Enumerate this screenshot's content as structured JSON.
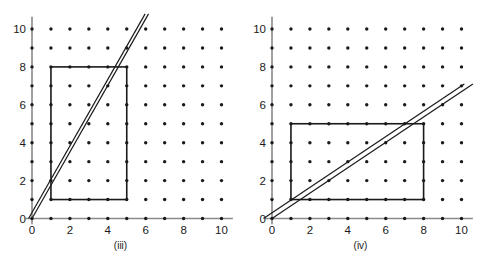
{
  "figure": {
    "panels": [
      {
        "id": "iii",
        "caption": "(iii)",
        "axes": {
          "x_ticks": [
            0,
            2,
            4,
            6,
            8,
            10
          ],
          "y_ticks": [
            0,
            2,
            4,
            6,
            8,
            10
          ],
          "x_min": 0,
          "x_max": 10,
          "y_min": 0,
          "y_max": 10,
          "x_label": "",
          "y_label": "",
          "axis_color": "#8a8a8a"
        },
        "lattice": {
          "x_values": [
            0,
            1,
            2,
            3,
            4,
            5,
            6,
            7,
            8,
            9,
            10
          ],
          "y_values": [
            0,
            1,
            2,
            3,
            4,
            5,
            6,
            7,
            8,
            9,
            10
          ],
          "dot_color": "#1a1a1a",
          "dot_radius_px": 1.7
        },
        "rectangle": {
          "x1": 1,
          "y1": 1,
          "x2": 5,
          "y2": 8,
          "stroke": "#1a1a1a",
          "stroke_width_px": 1.6,
          "fill": "none"
        },
        "lines": [
          {
            "name": "line-lower",
            "x1": 0.0,
            "y1": 0.0,
            "x2": 6.15,
            "y2": 10.8,
            "slope": 1.756,
            "intercept": 0.0
          },
          {
            "name": "line-upper",
            "x1": -0.18,
            "y1": 0.0,
            "x2": 5.97,
            "y2": 10.8,
            "slope": 1.756,
            "intercept": 0.32
          }
        ],
        "line_stroke": "#1a1a1a",
        "line_width_px": 1.2
      },
      {
        "id": "iv",
        "caption": "(iv)",
        "axes": {
          "x_ticks": [
            0,
            2,
            4,
            6,
            8,
            10
          ],
          "y_ticks": [
            0,
            2,
            4,
            6,
            8,
            10
          ],
          "x_min": 0,
          "x_max": 10,
          "y_min": 0,
          "y_max": 10,
          "x_label": "",
          "y_label": "",
          "axis_color": "#8a8a8a"
        },
        "lattice": {
          "x_values": [
            0,
            1,
            2,
            3,
            4,
            5,
            6,
            7,
            8,
            9,
            10
          ],
          "y_values": [
            0,
            1,
            2,
            3,
            4,
            5,
            6,
            7,
            8,
            9,
            10
          ],
          "dot_color": "#1a1a1a",
          "dot_radius_px": 1.7
        },
        "rectangle": {
          "x1": 1,
          "y1": 1,
          "x2": 8,
          "y2": 5,
          "stroke": "#1a1a1a",
          "stroke_width_px": 1.6,
          "fill": "none"
        },
        "lines": [
          {
            "name": "line-lower",
            "x1": 0.0,
            "y1": 0.0,
            "x2": 10.6,
            "y2": 7.1,
            "slope": 0.67,
            "intercept": 0.0
          },
          {
            "name": "line-upper",
            "x1": -0.45,
            "y1": 0.0,
            "x2": 10.15,
            "y2": 7.1,
            "slope": 0.67,
            "intercept": 0.3
          }
        ],
        "line_stroke": "#1a1a1a",
        "line_width_px": 1.2
      }
    ]
  },
  "chart_data": {
    "type": "scatter",
    "title": "",
    "subtitle": "",
    "xlabel": "",
    "ylabel": "",
    "xlim": [
      0,
      10
    ],
    "ylim": [
      0,
      10
    ],
    "grid": false,
    "legend": "none",
    "panels": [
      {
        "label": "(iii)",
        "description": "Integer lattice points 0..10 in x and y, a rectangle from (1,1) to (5,8), and two close parallel lines of slope about 1.75 through the origin region.",
        "lattice_points_x": [
          0,
          1,
          2,
          3,
          4,
          5,
          6,
          7,
          8,
          9,
          10
        ],
        "lattice_points_y": [
          0,
          1,
          2,
          3,
          4,
          5,
          6,
          7,
          8,
          9,
          10
        ],
        "rectangle": {
          "x_min": 1,
          "y_min": 1,
          "x_max": 5,
          "y_max": 8
        },
        "lines": [
          {
            "slope": 1.756,
            "intercept": 0.0
          },
          {
            "slope": 1.756,
            "intercept": 0.32
          }
        ],
        "xticks": [
          0,
          2,
          4,
          6,
          8,
          10
        ],
        "yticks": [
          0,
          2,
          4,
          6,
          8,
          10
        ]
      },
      {
        "label": "(iv)",
        "description": "Integer lattice points 0..10 in x and y, a rectangle from (1,1) to (8,5), and two close parallel lines of slope about 0.67 through the origin region.",
        "lattice_points_x": [
          0,
          1,
          2,
          3,
          4,
          5,
          6,
          7,
          8,
          9,
          10
        ],
        "lattice_points_y": [
          0,
          1,
          2,
          3,
          4,
          5,
          6,
          7,
          8,
          9,
          10
        ],
        "rectangle": {
          "x_min": 1,
          "y_min": 1,
          "x_max": 8,
          "y_max": 5
        },
        "lines": [
          {
            "slope": 0.67,
            "intercept": 0.0
          },
          {
            "slope": 0.67,
            "intercept": 0.3
          }
        ],
        "xticks": [
          0,
          2,
          4,
          6,
          8,
          10
        ],
        "yticks": [
          0,
          2,
          4,
          6,
          8,
          10
        ]
      }
    ]
  }
}
